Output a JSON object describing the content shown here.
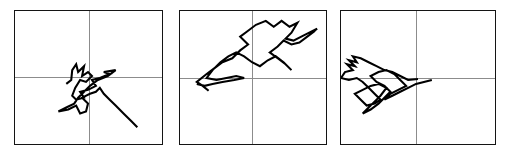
{
  "figure": {
    "width": 509,
    "height": 156,
    "background_color": "#ffffff",
    "panel_border_color": "#141414",
    "axis_color": "#8a8a8a",
    "path_color": "#000000",
    "panel_count": 3
  },
  "chart_data": {
    "type": "line",
    "title": "",
    "subtitle": "",
    "xlabel": "",
    "ylabel": "",
    "grid": false,
    "legend": null,
    "layout": "1 row x 3 columns of bordered panels, each with a crosshair origin",
    "panels": [
      {
        "name": "panel-1",
        "index": 1,
        "frame": {
          "x": 14,
          "y": 10,
          "width": 149,
          "height": 135
        },
        "origin": {
          "x": 90,
          "y": 78
        },
        "xlim": [
          -1,
          1
        ],
        "ylim": [
          -1,
          1
        ],
        "series": [
          {
            "name": "random-walk-1",
            "points": [
              [
                66,
                84
              ],
              [
                71,
                80
              ],
              [
                72,
                70
              ],
              [
                76,
                64
              ],
              [
                78,
                72
              ],
              [
                84,
                66
              ],
              [
                82,
                76
              ],
              [
                88,
                72
              ],
              [
                92,
                76
              ],
              [
                86,
                82
              ],
              [
                80,
                80
              ],
              [
                75,
                88
              ],
              [
                72,
                96
              ],
              [
                76,
                100
              ],
              [
                84,
                98
              ],
              [
                80,
                92
              ],
              [
                88,
                90
              ],
              [
                96,
                86
              ],
              [
                92,
                80
              ],
              [
                100,
                78
              ],
              [
                110,
                74
              ],
              [
                104,
                72
              ],
              [
                116,
                70
              ],
              [
                108,
                76
              ],
              [
                98,
                80
              ],
              [
                90,
                86
              ],
              [
                84,
                92
              ],
              [
                78,
                98
              ],
              [
                74,
                104
              ],
              [
                66,
                108
              ],
              [
                58,
                112
              ],
              [
                68,
                110
              ],
              [
                76,
                106
              ],
              [
                80,
                114
              ],
              [
                86,
                112
              ],
              [
                88,
                104
              ],
              [
                82,
                98
              ],
              [
                90,
                94
              ],
              [
                96,
                92
              ],
              [
                100,
                88
              ],
              [
                104,
                94
              ],
              [
                110,
                100
              ],
              [
                116,
                106
              ],
              [
                124,
                114
              ],
              [
                132,
                122
              ],
              [
                138,
                128
              ]
            ]
          }
        ]
      },
      {
        "name": "panel-2",
        "index": 2,
        "frame": {
          "x": 179,
          "y": 10,
          "width": 148,
          "height": 135
        },
        "origin": {
          "x": 252,
          "y": 79
        },
        "xlim": [
          -1,
          1
        ],
        "ylim": [
          -1,
          1
        ],
        "series": [
          {
            "name": "random-walk-2",
            "points": [
              [
                208,
                91
              ],
              [
                202,
                86
              ],
              [
                196,
                82
              ],
              [
                206,
                74
              ],
              [
                214,
                68
              ],
              [
                222,
                62
              ],
              [
                232,
                58
              ],
              [
                240,
                50
              ],
              [
                248,
                44
              ],
              [
                240,
                36
              ],
              [
                248,
                30
              ],
              [
                256,
                24
              ],
              [
                266,
                20
              ],
              [
                274,
                26
              ],
              [
                282,
                20
              ],
              [
                290,
                26
              ],
              [
                298,
                22
              ],
              [
                292,
                32
              ],
              [
                286,
                38
              ],
              [
                294,
                40
              ],
              [
                302,
                36
              ],
              [
                310,
                32
              ],
              [
                318,
                28
              ],
              [
                310,
                34
              ],
              [
                316,
                30
              ],
              [
                308,
                36
              ],
              [
                300,
                42
              ],
              [
                292,
                44
              ],
              [
                284,
                40
              ],
              [
                278,
                46
              ],
              [
                270,
                52
              ],
              [
                278,
                58
              ],
              [
                286,
                64
              ],
              [
                292,
                70
              ],
              [
                284,
                62
              ],
              [
                276,
                56
              ],
              [
                268,
                60
              ],
              [
                260,
                66
              ],
              [
                252,
                62
              ],
              [
                244,
                56
              ],
              [
                236,
                52
              ],
              [
                228,
                56
              ],
              [
                220,
                62
              ],
              [
                212,
                70
              ],
              [
                206,
                78
              ],
              [
                216,
                80
              ],
              [
                226,
                78
              ],
              [
                236,
                76
              ],
              [
                244,
                78
              ],
              [
                234,
                80
              ],
              [
                222,
                82
              ],
              [
                212,
                84
              ],
              [
                204,
                86
              ],
              [
                196,
                84
              ]
            ]
          }
        ]
      },
      {
        "name": "panel-3",
        "index": 3,
        "frame": {
          "x": 340,
          "y": 10,
          "width": 156,
          "height": 135
        },
        "origin": {
          "x": 416,
          "y": 79
        },
        "xlim": [
          -1,
          1
        ],
        "ylim": [
          -1,
          1
        ],
        "series": [
          {
            "name": "random-walk-3",
            "points": [
              [
                418,
                79
              ],
              [
                408,
                80
              ],
              [
                400,
                76
              ],
              [
                392,
                72
              ],
              [
                384,
                70
              ],
              [
                376,
                66
              ],
              [
                368,
                62
              ],
              [
                360,
                58
              ],
              [
                352,
                56
              ],
              [
                356,
                62
              ],
              [
                348,
                60
              ],
              [
                354,
                66
              ],
              [
                346,
                64
              ],
              [
                352,
                70
              ],
              [
                344,
                72
              ],
              [
                340,
                78
              ],
              [
                348,
                80
              ],
              [
                356,
                78
              ],
              [
                362,
                82
              ],
              [
                368,
                88
              ],
              [
                374,
                94
              ],
              [
                380,
                100
              ],
              [
                374,
                104
              ],
              [
                366,
                106
              ],
              [
                360,
                100
              ],
              [
                354,
                94
              ],
              [
                362,
                90
              ],
              [
                370,
                86
              ],
              [
                378,
                84
              ],
              [
                386,
                88
              ],
              [
                380,
                96
              ],
              [
                374,
                102
              ],
              [
                368,
                108
              ],
              [
                362,
                114
              ],
              [
                370,
                110
              ],
              [
                378,
                104
              ],
              [
                384,
                98
              ],
              [
                390,
                92
              ],
              [
                384,
                86
              ],
              [
                376,
                82
              ],
              [
                370,
                76
              ],
              [
                378,
                72
              ],
              [
                386,
                70
              ],
              [
                394,
                74
              ],
              [
                400,
                80
              ],
              [
                406,
                86
              ],
              [
                398,
                90
              ],
              [
                390,
                94
              ],
              [
                384,
                100
              ],
              [
                392,
                96
              ],
              [
                400,
                92
              ],
              [
                408,
                88
              ],
              [
                416,
                84
              ],
              [
                424,
                82
              ],
              [
                432,
                80
              ]
            ]
          }
        ]
      }
    ]
  }
}
